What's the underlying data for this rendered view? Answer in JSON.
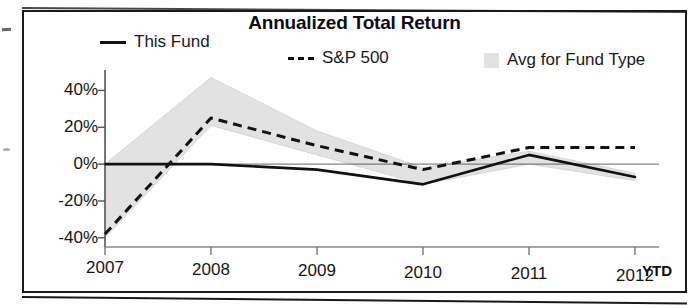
{
  "chart_data": {
    "type": "line",
    "title": "Annualized Total Return",
    "xlabel": "",
    "ylabel": "",
    "x": [
      "2007",
      "2008",
      "2009",
      "2010",
      "2011",
      "2012"
    ],
    "categories": [
      "2007",
      "2008",
      "2009",
      "2010",
      "2011",
      "2012"
    ],
    "ylim": [
      -45,
      50
    ],
    "yticks": [
      40,
      20,
      0,
      -20,
      -40
    ],
    "ytick_labels": [
      "40%",
      "20%",
      "0%",
      "-20%",
      "-40%"
    ],
    "grid": false,
    "legend_position": "top",
    "annotations": [
      "YTD"
    ],
    "series": [
      {
        "name": "This Fund",
        "style": "solid",
        "color": "#111111",
        "values": [
          0,
          0,
          -3,
          -11,
          5,
          -7
        ]
      },
      {
        "name": "S&P 500",
        "style": "dashed",
        "color": "#111111",
        "values": [
          -38,
          25,
          10,
          -3,
          9,
          9
        ]
      },
      {
        "name": "Avg for Fund Type",
        "style": "band",
        "color": "#e2e2e2",
        "upper": [
          0,
          47,
          18,
          -2,
          7,
          -5
        ],
        "lower": [
          -40,
          21,
          5,
          -11,
          0,
          -9
        ]
      }
    ]
  },
  "header": {
    "title": "Annualized Total Return"
  },
  "legend": {
    "items": [
      {
        "label": "This Fund",
        "marker": "solid-line-swatch"
      },
      {
        "label": "S&P 500",
        "marker": "dashed-line-swatch"
      },
      {
        "label": "Avg for Fund Type",
        "marker": "gray-band-swatch"
      }
    ]
  },
  "axes": {
    "y_tick_labels": [
      "40%",
      "20%",
      "0%",
      "-20%",
      "-40%"
    ],
    "x_tick_labels": [
      "2007",
      "2008",
      "2009",
      "2010",
      "2011",
      "2012"
    ],
    "x_suffix_label": "YTD"
  }
}
